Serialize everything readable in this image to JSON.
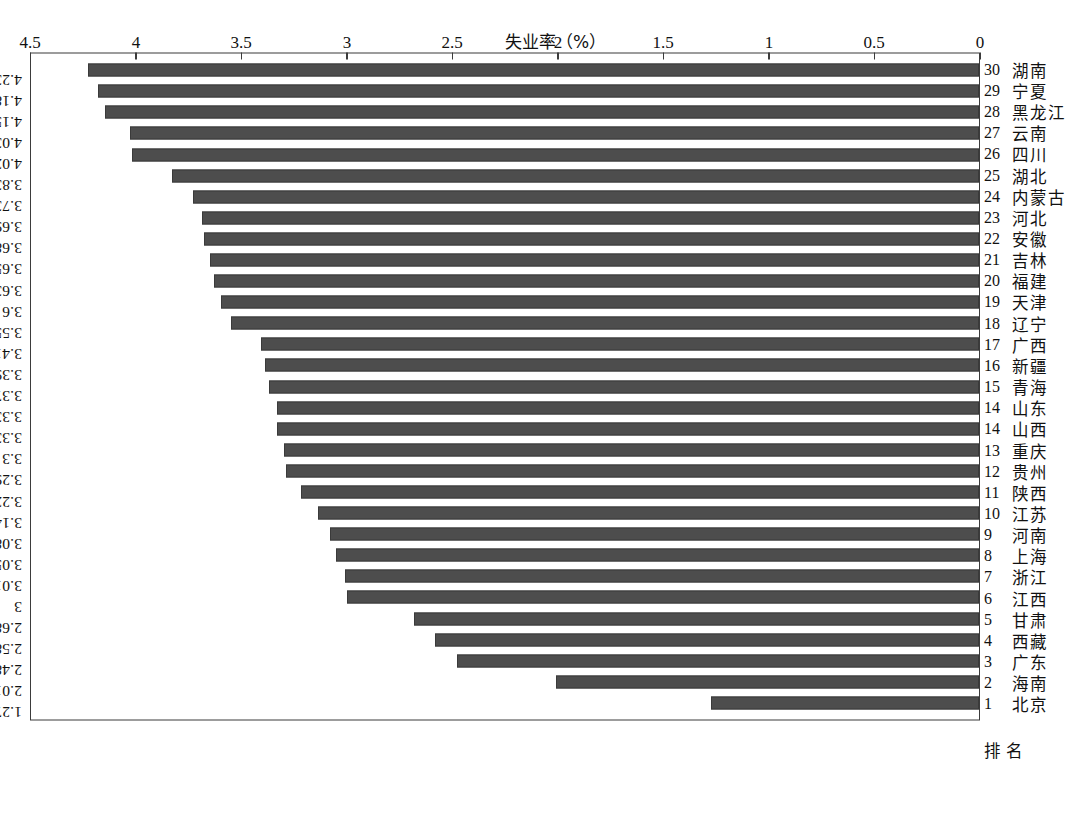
{
  "figure": {
    "orientation": "page-rotated-90",
    "background": "#ffffff",
    "bar_color": "#4d4d4d",
    "axis_color": "#3b3b3b",
    "row_headers": {
      "rank": "排  名",
      "name": ""
    }
  },
  "chart_data": {
    "type": "bar",
    "title": "",
    "xlabel": "",
    "ylabel": "失业率（%）",
    "ylim": [
      0,
      4.5
    ],
    "yticks": [
      0,
      0.5,
      1,
      1.5,
      2,
      2.5,
      3,
      3.5,
      4,
      4.5
    ],
    "ytick_labels": [
      "0",
      "0.5",
      "1",
      "1.5",
      "2",
      "2.5",
      "3",
      "3.5",
      "4",
      "4.5"
    ],
    "grid": false,
    "legend": null,
    "categories": [
      "北京",
      "海南",
      "广东",
      "西藏",
      "甘肃",
      "江西",
      "浙江",
      "上海",
      "河南",
      "江苏",
      "陕西",
      "贵州",
      "重庆",
      "山西",
      "山东",
      "青海",
      "新疆",
      "广西",
      "辽宁",
      "天津",
      "福建",
      "吉林",
      "安徽",
      "河北",
      "内蒙古",
      "湖北",
      "四川",
      "云南",
      "黑龙江",
      "宁夏",
      "湖南"
    ],
    "ranks": [
      "1",
      "2",
      "3",
      "4",
      "5",
      "6",
      "7",
      "8",
      "9",
      "10",
      "11",
      "12",
      "13",
      "14",
      "14",
      "15",
      "16",
      "17",
      "18",
      "19",
      "20",
      "21",
      "22",
      "23",
      "24",
      "25",
      "26",
      "27",
      "28",
      "29",
      "30"
    ],
    "values": [
      1.27,
      2.01,
      2.48,
      2.58,
      2.68,
      3,
      3.01,
      3.05,
      3.08,
      3.14,
      3.22,
      3.29,
      3.3,
      3.33,
      3.33,
      3.37,
      3.39,
      3.41,
      3.55,
      3.6,
      3.63,
      3.65,
      3.68,
      3.69,
      3.73,
      3.83,
      4.02,
      4.03,
      4.15,
      4.18,
      4.23
    ],
    "value_labels": [
      "1.27",
      "2.01",
      "2.48",
      "2.58",
      "2.68",
      "3",
      "3.01",
      "3.05",
      "3.08",
      "3.14",
      "3.22",
      "3.29",
      "3.3",
      "3.33",
      "3.33",
      "3.37",
      "3.39",
      "3.41",
      "3.55",
      "3.6",
      "3.63",
      "3.65",
      "3.68",
      "3.69",
      "3.73",
      "3.83",
      "4.02",
      "4.03",
      "4.15",
      "4.18",
      "4.23"
    ]
  }
}
